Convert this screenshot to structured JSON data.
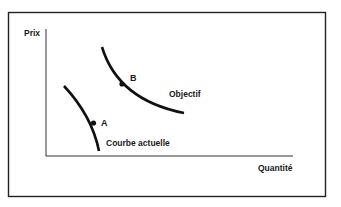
{
  "diagram": {
    "type": "price-quantity curve shift diagram",
    "axes": {
      "y_label": "Prix",
      "x_label": "Quantité"
    },
    "curves": [
      {
        "id": "current",
        "label": "Courbe actuelle",
        "point_label": "A"
      },
      {
        "id": "target",
        "label": "Objectif",
        "point_label": "B"
      }
    ],
    "colors": {
      "line": "#111111",
      "text": "#1a1a1a",
      "background": "#ffffff"
    }
  }
}
